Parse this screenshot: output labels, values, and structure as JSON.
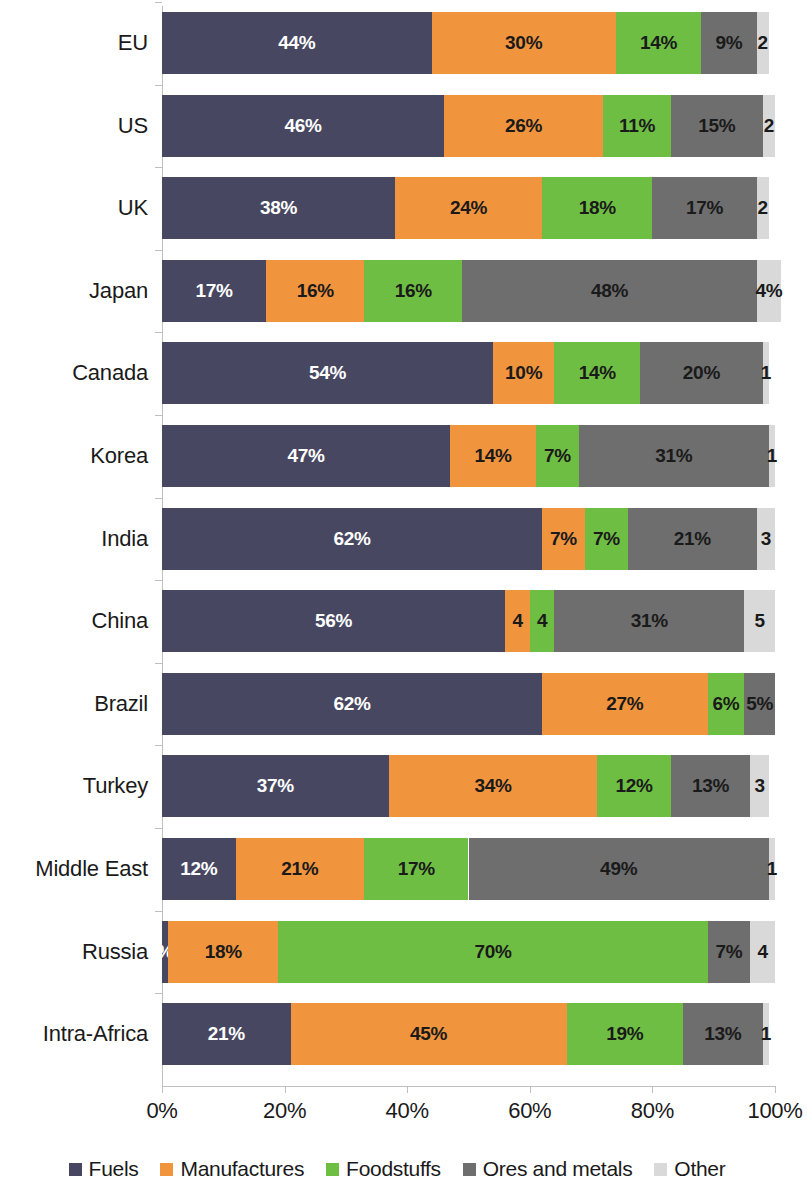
{
  "chart_data": {
    "type": "bar",
    "subtype": "stacked-horizontal-100-percent",
    "title": "",
    "xlabel": "",
    "ylabel": "",
    "xlim": [
      0,
      100
    ],
    "xticks": [
      0,
      20,
      40,
      60,
      80,
      100
    ],
    "xtick_labels": [
      "0%",
      "20%",
      "40%",
      "60%",
      "80%",
      "100%"
    ],
    "grid": false,
    "legend_position": "bottom",
    "categories": [
      "EU",
      "US",
      "UK",
      "Japan",
      "Canada",
      "Korea",
      "India",
      "China",
      "Brazil",
      "Turkey",
      "Middle East",
      "Russia",
      "Intra-Africa"
    ],
    "series": [
      {
        "name": "Fuels",
        "color": "#474761",
        "values": [
          44,
          46,
          38,
          17,
          54,
          47,
          62,
          56,
          62,
          37,
          12,
          1,
          21
        ],
        "labels": [
          "44%",
          "46%",
          "38%",
          "17%",
          "54%",
          "47%",
          "62%",
          "56%",
          "62%",
          "37%",
          "12%",
          "%",
          "21%"
        ]
      },
      {
        "name": "Manufactures",
        "color": "#F0943E",
        "values": [
          30,
          26,
          24,
          16,
          10,
          14,
          7,
          4,
          27,
          34,
          21,
          18,
          45
        ],
        "labels": [
          "30%",
          "26%",
          "24%",
          "16%",
          "10%",
          "14%",
          "7%",
          "4",
          "27%",
          "34%",
          "21%",
          "18%",
          "45%"
        ]
      },
      {
        "name": "Foodstuffs",
        "color": "#6FBE44",
        "values": [
          14,
          11,
          18,
          16,
          14,
          7,
          7,
          4,
          6,
          12,
          17,
          70,
          19
        ],
        "labels": [
          "14%",
          "11%",
          "18%",
          "16%",
          "14%",
          "7%",
          "7%",
          "4",
          "6%",
          "12%",
          "17%",
          "70%",
          "19%"
        ]
      },
      {
        "name": "Ores and metals",
        "color": "#6E6E6E",
        "values": [
          9,
          15,
          17,
          48,
          20,
          31,
          21,
          31,
          5,
          13,
          49,
          7,
          13
        ],
        "labels": [
          "9%",
          "15%",
          "17%",
          "48%",
          "20%",
          "31%",
          "21%",
          "31%",
          "5%",
          "13%",
          "49%",
          "7%",
          "13%"
        ]
      },
      {
        "name": "Other",
        "color": "#D9D9D9",
        "values": [
          2,
          2,
          2,
          4,
          1,
          1,
          3,
          5,
          0,
          3,
          1,
          4,
          1
        ],
        "labels": [
          "2",
          "2",
          "2",
          "4%",
          "1",
          "1",
          "3",
          "5",
          "",
          "3",
          "1",
          "4",
          "1"
        ]
      }
    ],
    "legend": [
      {
        "label": "Fuels",
        "color": "#474761"
      },
      {
        "label": "Manufactures",
        "color": "#F0943E"
      },
      {
        "label": "Foodstuffs",
        "color": "#6FBE44"
      },
      {
        "label": "Ores and metals",
        "color": "#6E6E6E"
      },
      {
        "label": "Other",
        "color": "#D9D9D9"
      }
    ]
  }
}
